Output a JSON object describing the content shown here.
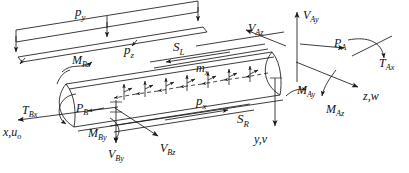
{
  "figure": {
    "name": "beam-free-body-diagram",
    "background_color": "#ffffff",
    "line_color": "#1a1a1a",
    "width": 409,
    "height": 173
  },
  "labels": {
    "p_y": {
      "base": "p",
      "sub": "y",
      "x": 75,
      "y": 5,
      "size": "s13"
    },
    "p_z": {
      "base": "p",
      "sub": "z",
      "x": 124,
      "y": 43,
      "size": "s13"
    },
    "S_L": {
      "base": "S",
      "sub": "L",
      "x": 173,
      "y": 40,
      "size": "s13"
    },
    "m_x": {
      "base": "m",
      "sub": "x",
      "x": 196,
      "y": 62,
      "size": "s12"
    },
    "p_x": {
      "base": "p",
      "sub": "x",
      "x": 196,
      "y": 94,
      "size": "s13"
    },
    "S_R": {
      "base": "S",
      "sub": "R",
      "x": 237,
      "y": 112,
      "size": "s13"
    },
    "M_Bz": {
      "base": "M",
      "sub": "Bz",
      "x": 72,
      "y": 54,
      "size": "s12"
    },
    "T_Bx": {
      "base": "T",
      "sub": "Bx",
      "x": 22,
      "y": 104,
      "size": "s12"
    },
    "P_B": {
      "base": "P",
      "sub": "B",
      "x": 76,
      "y": 102,
      "size": "s12"
    },
    "M_By": {
      "base": "M",
      "sub": "By",
      "x": 88,
      "y": 127,
      "size": "s12"
    },
    "x_uo": {
      "base": "x,u",
      "sub": "o",
      "x": 3,
      "y": 126,
      "size": "s12"
    },
    "V_By": {
      "base": "V",
      "sub": "By",
      "x": 108,
      "y": 148,
      "size": "s12"
    },
    "V_Bz": {
      "base": "V",
      "sub": "Bz",
      "x": 160,
      "y": 142,
      "size": "s12"
    },
    "V_Az": {
      "base": "V",
      "sub": "Az",
      "x": 248,
      "y": 22,
      "size": "s12"
    },
    "V_Ay": {
      "base": "V",
      "sub": "Ay",
      "x": 303,
      "y": 9,
      "size": "s12"
    },
    "P_A": {
      "base": "P",
      "sub": "A",
      "x": 334,
      "y": 37,
      "size": "s12"
    },
    "T_Ax": {
      "base": "T",
      "sub": "Ax",
      "x": 379,
      "y": 57,
      "size": "s12"
    },
    "M_Ay": {
      "base": "M",
      "sub": "Ay",
      "x": 297,
      "y": 84,
      "size": "s12"
    },
    "M_Az": {
      "base": "M",
      "sub": "Az",
      "x": 326,
      "y": 103,
      "size": "s12"
    },
    "z_w": {
      "base": "z,w",
      "sub": "",
      "x": 363,
      "y": 90,
      "size": "s12"
    },
    "y_v": {
      "base": "y,v",
      "sub": "",
      "x": 254,
      "y": 133,
      "size": "s12"
    }
  }
}
